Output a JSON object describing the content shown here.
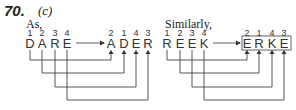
{
  "question": {
    "number": "70.",
    "answer_option": "(c)"
  },
  "example": {
    "intro": "As,",
    "source": {
      "numbers": [
        "1",
        "2",
        "3",
        "4"
      ],
      "letters": [
        "D",
        "A",
        "R",
        "E"
      ]
    },
    "result": {
      "numbers": [
        "2",
        "1",
        "4",
        "3"
      ],
      "letters": [
        "A",
        "D",
        "E",
        "R"
      ]
    }
  },
  "similar": {
    "intro": "Similarly,",
    "source": {
      "numbers": [
        "1",
        "2",
        "3",
        "4"
      ],
      "letters": [
        "R",
        "E",
        "E",
        "K"
      ]
    },
    "result": {
      "numbers": [
        "2",
        "1",
        "4",
        "3"
      ],
      "letters": [
        "E",
        "R",
        "K",
        "E"
      ]
    },
    "result_boxed": true
  }
}
